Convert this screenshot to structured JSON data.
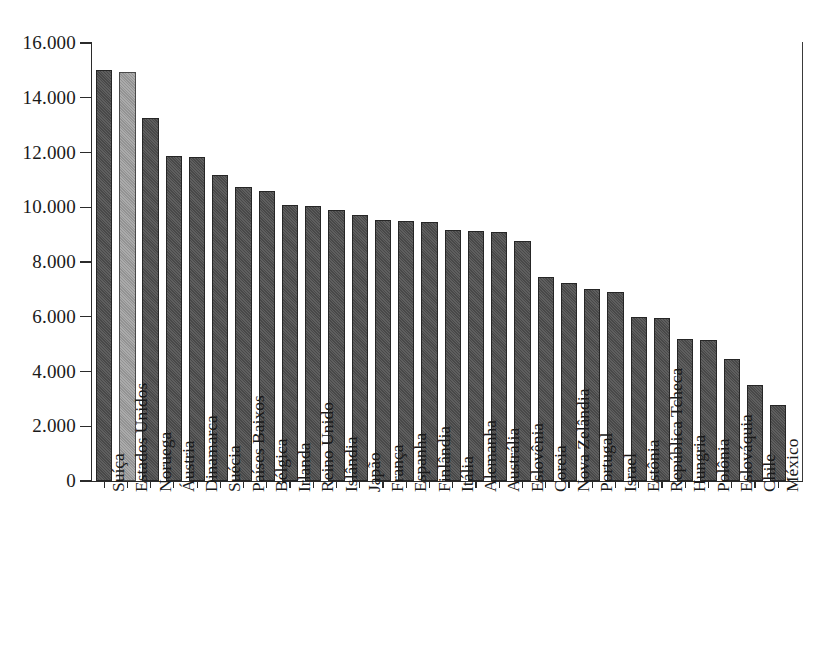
{
  "chart_data": {
    "type": "bar",
    "title": "",
    "subtitle": "",
    "xlabel": "",
    "ylabel": "",
    "ylim": [
      0,
      16000
    ],
    "ytick_labels": [
      "0",
      "2.000",
      "4.000",
      "6.000",
      "8.000",
      "10.000",
      "12.000",
      "14.000",
      "16.000"
    ],
    "ytick_values": [
      0,
      2000,
      4000,
      6000,
      8000,
      10000,
      12000,
      14000,
      16000
    ],
    "grid": false,
    "legend": "none",
    "thousands_separator": ".",
    "highlight_category": "Estados Unidos",
    "bar_color": "#4d4d4d",
    "highlight_color": "#9b9b9b",
    "bar_border_color": "#262626",
    "axis_color": "#2b2b2b",
    "background_color": "#ffffff",
    "categories": [
      "Suíça",
      "Estados Unidos",
      "Noruega",
      "Áustria",
      "Dinamarca",
      "Suécia",
      "Países Baixos",
      "Bélgica",
      "Irlanda",
      "Reino Unido",
      "Islândia",
      "Japão",
      "França",
      "Espanha",
      "Finlândia",
      "Itália",
      "Alemanha",
      "Austrália",
      "Eslovênia",
      "Coreia",
      "Nova Zelândia",
      "Portugal",
      "Israel",
      "Estônia",
      "República Tcheca",
      "Hungria",
      "Polônia",
      "Eslováquia",
      "Chile",
      "México"
    ],
    "values": [
      15000,
      14950,
      13250,
      11880,
      11820,
      11180,
      10740,
      10600,
      10100,
      10050,
      9900,
      9700,
      9550,
      9500,
      9480,
      9170,
      9150,
      9080,
      8750,
      7450,
      7250,
      7030,
      6920,
      6000,
      5950,
      5180,
      5150,
      4470,
      3510,
      2780
    ]
  }
}
